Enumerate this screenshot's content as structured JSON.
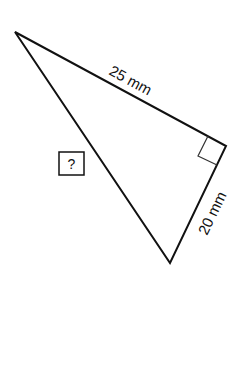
{
  "diagram": {
    "type": "right-triangle",
    "vertices": {
      "top_left": [
        15,
        32
      ],
      "right_angle": [
        226,
        146
      ],
      "bottom": [
        170,
        263
      ]
    },
    "sides": [
      {
        "id": "leg_long",
        "label": "25 mm",
        "from": "top_left",
        "to": "right_angle"
      },
      {
        "id": "leg_short",
        "label": "20 mm",
        "from": "right_angle",
        "to": "bottom"
      },
      {
        "id": "hypotenuse",
        "label": "?",
        "from": "top_left",
        "to": "bottom",
        "boxed": true
      }
    ],
    "right_angle_marker": true,
    "stroke_color": "#111111",
    "background": "#ffffff"
  }
}
